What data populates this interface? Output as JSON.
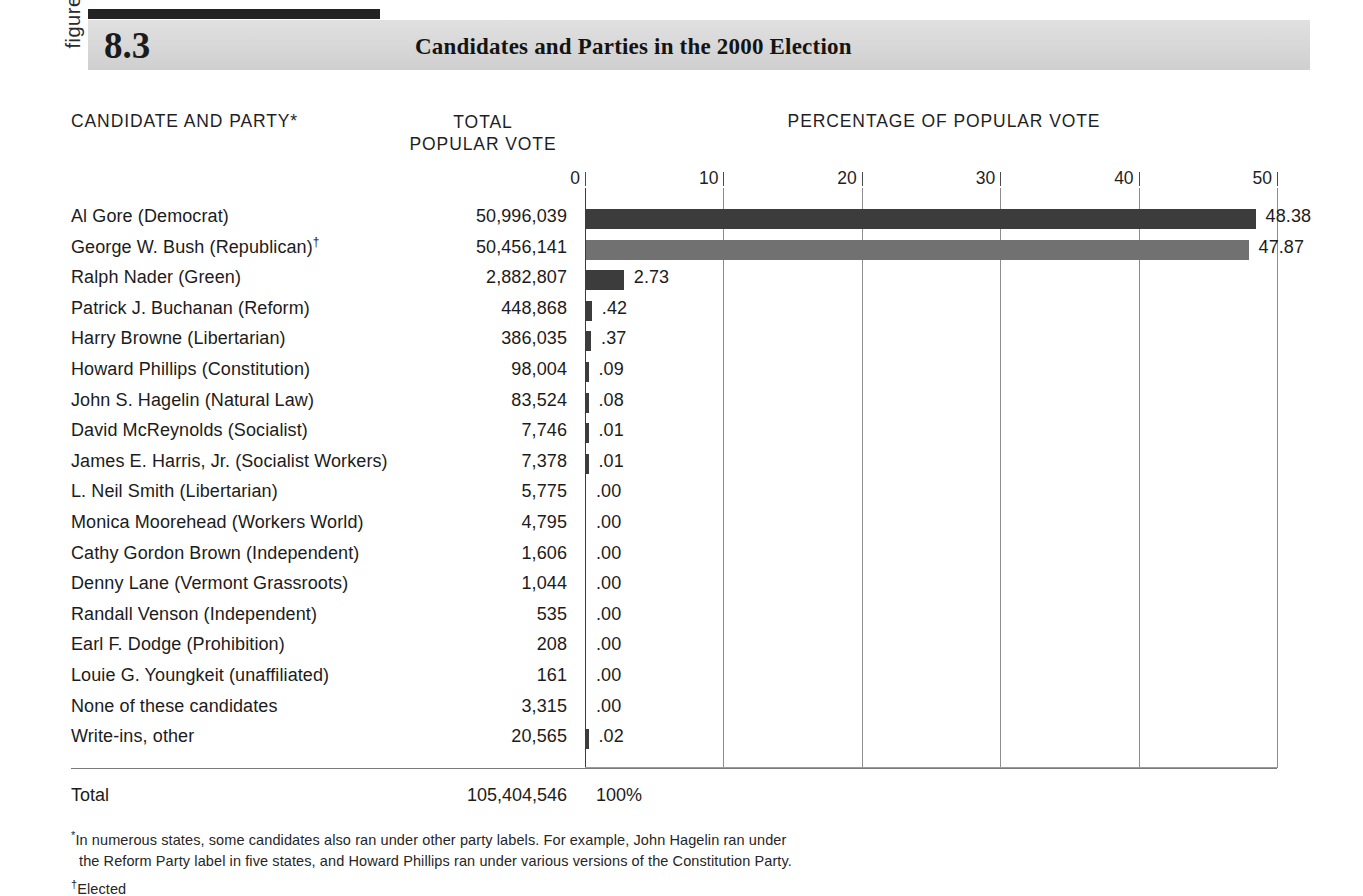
{
  "figure": {
    "kicker": "figure",
    "number": "8.3",
    "title": "Candidates and Parties in the 2000 Election"
  },
  "columns": {
    "candidate": "CANDIDATE AND PARTY*",
    "votes": "TOTAL\nPOPULAR VOTE",
    "percentage": "PERCENTAGE OF POPULAR VOTE"
  },
  "total": {
    "label": "Total",
    "votes": "105,404,546",
    "percent": "100%"
  },
  "footnotes": {
    "star_marker": "*",
    "star_line1": "In numerous states, some candidates also ran under other party labels. For example, John Hagelin ran under",
    "star_line2": "the Reform Party label in five states, and Howard Phillips ran under various versions of the Constitution Party.",
    "dagger_marker": "†",
    "dagger_text": "Elected"
  },
  "colors": {
    "bar_dark": "#3c3c3c",
    "bar_light": "#717171",
    "header_band": "#d9d9d9",
    "header_rule": "#232323",
    "gridline": "#8d8d8d"
  },
  "chart_data": {
    "type": "bar",
    "orientation": "horizontal",
    "title": "Candidates and Parties in the 2000 Election",
    "xlabel": "PERCENTAGE OF POPULAR VOTE",
    "ylabel": "CANDIDATE AND PARTY*",
    "xlim": [
      0,
      50
    ],
    "ticks": [
      0,
      10,
      20,
      30,
      40,
      50
    ],
    "tick_labels": [
      "0",
      "10",
      "20",
      "30",
      "40",
      "50"
    ],
    "grid": true,
    "legend": "none",
    "categories": [
      "Al Gore (Democrat)",
      "George W. Bush (Republican)†",
      "Ralph Nader (Green)",
      "Patrick J. Buchanan (Reform)",
      "Harry Browne (Libertarian)",
      "Howard Phillips (Constitution)",
      "John S. Hagelin (Natural Law)",
      "David McReynolds (Socialist)",
      "James E. Harris, Jr. (Socialist Workers)",
      "L. Neil Smith (Libertarian)",
      "Monica Moorehead (Workers World)",
      "Cathy Gordon Brown (Independent)",
      "Denny Lane (Vermont Grassroots)",
      "Randall Venson (Independent)",
      "Earl F. Dodge (Prohibition)",
      "Louie G. Youngkeit (unaffiliated)",
      "None of these candidates",
      "Write-ins, other"
    ],
    "values": [
      48.38,
      47.87,
      2.73,
      0.42,
      0.37,
      0.09,
      0.08,
      0.01,
      0.01,
      0.0,
      0.0,
      0.0,
      0.0,
      0.0,
      0.0,
      0.0,
      0.0,
      0.02
    ],
    "rows": [
      {
        "candidate": "Al Gore (Democrat)",
        "marker": "",
        "votes": "50,996,039",
        "votes_num": 50996039,
        "pct": 48.38,
        "pct_label": "48.38",
        "bar": "dark"
      },
      {
        "candidate": "George W. Bush (Republican)",
        "marker": "†",
        "votes": "50,456,141",
        "votes_num": 50456141,
        "pct": 47.87,
        "pct_label": "47.87",
        "bar": "light"
      },
      {
        "candidate": "Ralph Nader (Green)",
        "marker": "",
        "votes": "2,882,807",
        "votes_num": 2882807,
        "pct": 2.73,
        "pct_label": "2.73",
        "bar": "dark"
      },
      {
        "candidate": "Patrick J. Buchanan (Reform)",
        "marker": "",
        "votes": "448,868",
        "votes_num": 448868,
        "pct": 0.42,
        "pct_label": ".42",
        "bar": "dark"
      },
      {
        "candidate": "Harry Browne (Libertarian)",
        "marker": "",
        "votes": "386,035",
        "votes_num": 386035,
        "pct": 0.37,
        "pct_label": ".37",
        "bar": "dark"
      },
      {
        "candidate": "Howard Phillips (Constitution)",
        "marker": "",
        "votes": "98,004",
        "votes_num": 98004,
        "pct": 0.09,
        "pct_label": ".09",
        "bar": "dark"
      },
      {
        "candidate": "John S. Hagelin (Natural Law)",
        "marker": "",
        "votes": "83,524",
        "votes_num": 83524,
        "pct": 0.08,
        "pct_label": ".08",
        "bar": "dark"
      },
      {
        "candidate": "David McReynolds (Socialist)",
        "marker": "",
        "votes": "7,746",
        "votes_num": 7746,
        "pct": 0.01,
        "pct_label": ".01",
        "bar": "dark"
      },
      {
        "candidate": "James E. Harris, Jr. (Socialist Workers)",
        "marker": "",
        "votes": "7,378",
        "votes_num": 7378,
        "pct": 0.01,
        "pct_label": ".01",
        "bar": "dark"
      },
      {
        "candidate": "L. Neil Smith (Libertarian)",
        "marker": "",
        "votes": "5,775",
        "votes_num": 5775,
        "pct": 0.0,
        "pct_label": ".00",
        "bar": "none"
      },
      {
        "candidate": "Monica Moorehead (Workers World)",
        "marker": "",
        "votes": "4,795",
        "votes_num": 4795,
        "pct": 0.0,
        "pct_label": ".00",
        "bar": "none"
      },
      {
        "candidate": "Cathy Gordon Brown (Independent)",
        "marker": "",
        "votes": "1,606",
        "votes_num": 1606,
        "pct": 0.0,
        "pct_label": ".00",
        "bar": "none"
      },
      {
        "candidate": "Denny Lane (Vermont Grassroots)",
        "marker": "",
        "votes": "1,044",
        "votes_num": 1044,
        "pct": 0.0,
        "pct_label": ".00",
        "bar": "none"
      },
      {
        "candidate": "Randall Venson (Independent)",
        "marker": "",
        "votes": "535",
        "votes_num": 535,
        "pct": 0.0,
        "pct_label": ".00",
        "bar": "none"
      },
      {
        "candidate": "Earl F. Dodge (Prohibition)",
        "marker": "",
        "votes": "208",
        "votes_num": 208,
        "pct": 0.0,
        "pct_label": ".00",
        "bar": "none"
      },
      {
        "candidate": "Louie G. Youngkeit (unaffiliated)",
        "marker": "",
        "votes": "161",
        "votes_num": 161,
        "pct": 0.0,
        "pct_label": ".00",
        "bar": "none"
      },
      {
        "candidate": "None of these candidates",
        "marker": "",
        "votes": "3,315",
        "votes_num": 3315,
        "pct": 0.0,
        "pct_label": ".00",
        "bar": "none"
      },
      {
        "candidate": "Write-ins, other",
        "marker": "",
        "votes": "20,565",
        "votes_num": 20565,
        "pct": 0.02,
        "pct_label": ".02",
        "bar": "dark"
      }
    ],
    "total": {
      "votes": "105,404,546",
      "percent": "100%"
    }
  }
}
